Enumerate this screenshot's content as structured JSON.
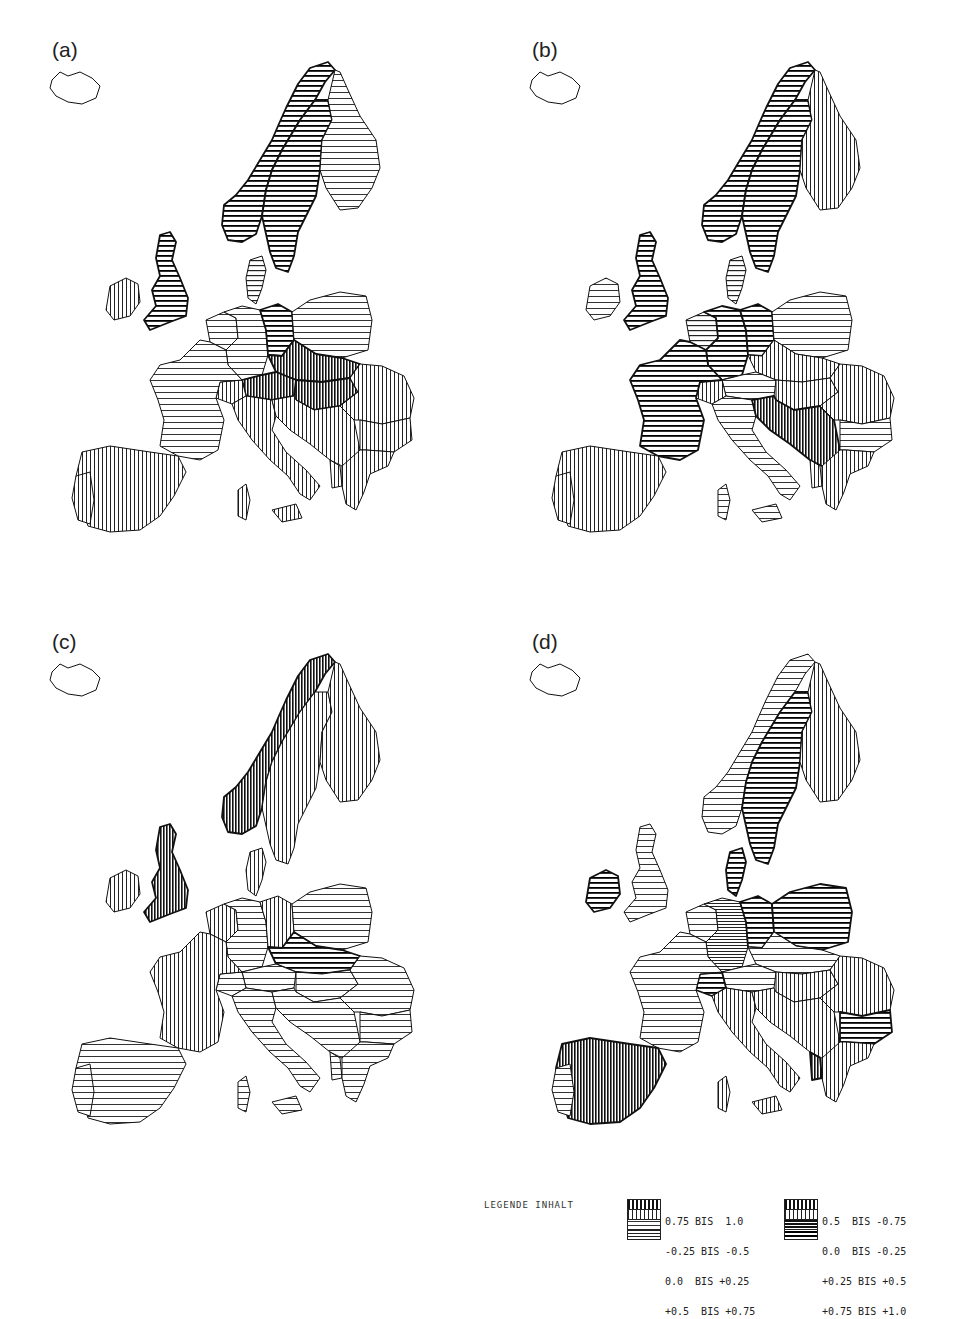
{
  "figure": {
    "panels": [
      {
        "id": "a",
        "label": "(a)"
      },
      {
        "id": "b",
        "label": "(b)"
      },
      {
        "id": "c",
        "label": "(c)"
      },
      {
        "id": "d",
        "label": "(d)"
      }
    ],
    "legend": {
      "title": "LEGENDE INHALT",
      "groups": [
        {
          "lines": [
            "0.75 BIS  1.0",
            "-0.25 BIS -0.5",
            "0.0  BIS +0.25",
            "+0.5  BIS +0.75"
          ],
          "patterns": [
            "vertical-dense",
            "vertical",
            "horizontal-sparse",
            "horizontal"
          ]
        },
        {
          "lines": [
            "0.5  BIS -0.75",
            "0.0  BIS -0.25",
            "+0.25 BIS +0.5",
            "+0.75 BIS +1.0"
          ],
          "patterns": [
            "vertical-dense",
            "vertical",
            "horizontal-dense",
            "horizontal-bold"
          ]
        }
      ]
    }
  },
  "map_data": {
    "type": "choropleth-hatched",
    "region": "Europe",
    "classes": [
      {
        "range": "-0.75 to -1.0",
        "pattern": "vertical-dense"
      },
      {
        "range": "-0.5 to -0.75",
        "pattern": "vertical-dense"
      },
      {
        "range": "-0.25 to -0.5",
        "pattern": "vertical"
      },
      {
        "range": "0.0 to -0.25",
        "pattern": "vertical"
      },
      {
        "range": "0.0 to +0.25",
        "pattern": "horizontal-sparse"
      },
      {
        "range": "+0.25 to +0.5",
        "pattern": "horizontal-dense"
      },
      {
        "range": "+0.5 to +0.75",
        "pattern": "horizontal"
      },
      {
        "range": "+0.75 to +1.0",
        "pattern": "horizontal-bold"
      }
    ],
    "panels": {
      "a": {
        "norway": "horizontal-bold",
        "sweden": "horizontal-bold",
        "finland": "horizontal-sparse",
        "uk": "horizontal-bold",
        "ireland": "vertical",
        "denmark": "horizontal",
        "benelux": "horizontal-sparse",
        "germany_w": "horizontal-sparse",
        "germany_e": "horizontal-bold",
        "poland": "horizontal-sparse",
        "czechoslovakia": "vertical-dense",
        "hungary": "vertical-dense",
        "austria": "vertical-dense",
        "france": "horizontal-sparse",
        "switzerland": "vertical",
        "iberia": "vertical",
        "italy": "vertical",
        "yugoslavia": "vertical",
        "romania": "vertical",
        "bulgaria": "vertical",
        "greece": "vertical",
        "albania": "vertical"
      },
      "b": {
        "norway": "horizontal-bold",
        "sweden": "horizontal-bold",
        "finland": "vertical",
        "uk": "horizontal-bold",
        "ireland": "horizontal-sparse",
        "denmark": "horizontal",
        "benelux": "horizontal",
        "germany_w": "horizontal-bold",
        "germany_e": "horizontal-bold",
        "poland": "horizontal-sparse",
        "czechoslovakia": "vertical",
        "hungary": "vertical",
        "austria": "horizontal-sparse",
        "france": "horizontal-bold",
        "switzerland": "vertical",
        "iberia": "vertical",
        "italy": "horizontal-sparse",
        "yugoslavia": "vertical-dense",
        "romania": "vertical",
        "bulgaria": "horizontal-sparse",
        "greece": "vertical",
        "albania": "vertical"
      },
      "c": {
        "norway": "vertical-dense",
        "sweden": "vertical",
        "finland": "vertical",
        "uk": "vertical-dense",
        "ireland": "vertical",
        "denmark": "vertical",
        "benelux": "vertical",
        "germany_w": "horizontal-sparse",
        "germany_e": "vertical",
        "poland": "horizontal-sparse",
        "czechoslovakia": "horizontal-bold",
        "hungary": "horizontal-sparse",
        "austria": "horizontal-sparse",
        "france": "vertical",
        "switzerland": "horizontal-sparse",
        "iberia": "horizontal-sparse",
        "italy": "horizontal-sparse",
        "yugoslavia": "horizontal-sparse",
        "romania": "horizontal-sparse",
        "bulgaria": "horizontal-sparse",
        "greece": "horizontal-sparse",
        "albania": "horizontal-sparse"
      },
      "d": {
        "norway": "horizontal-sparse",
        "sweden": "horizontal-bold",
        "finland": "vertical",
        "uk": "horizontal-sparse",
        "ireland": "horizontal-bold",
        "denmark": "horizontal-bold",
        "benelux": "horizontal-sparse",
        "germany_w": "horizontal-dense",
        "germany_e": "horizontal-bold",
        "poland": "horizontal-bold",
        "czechoslovakia": "horizontal-sparse",
        "hungary": "vertical",
        "austria": "horizontal-sparse",
        "france": "horizontal-sparse",
        "switzerland": "horizontal-bold",
        "iberia": "vertical-dense",
        "portugal": "horizontal-sparse",
        "italy": "vertical",
        "yugoslavia": "vertical",
        "romania": "vertical",
        "bulgaria": "horizontal-bold",
        "greece": "vertical",
        "albania": "vertical-dense"
      }
    }
  }
}
